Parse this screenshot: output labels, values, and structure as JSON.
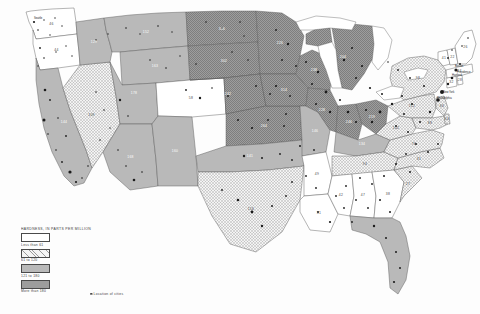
{
  "map": {
    "title": "Water hardness of public supplies in the United States",
    "legend": {
      "header": "HARDNESS, IN PARTS PER MILLION",
      "classes": [
        {
          "label": "Less than 61",
          "fill": "#ffffff",
          "pattern": "none"
        },
        {
          "label": "61 to 120",
          "fill": "#e8e8e8",
          "pattern": "crosshatch"
        },
        {
          "label": "121 to 180",
          "fill": "#b9b9b9",
          "pattern": "solid"
        },
        {
          "label": "More than 180",
          "fill": "#8c8c8c",
          "pattern": "stipple"
        }
      ],
      "city_note": "Location of cities"
    },
    "projection": "Albers equal-area conic, conterminous United States",
    "ocean_color": "#ffffff",
    "border_color": "#555555",
    "state_values": [
      {
        "state": "Washington",
        "abbr": "WA",
        "class": 0,
        "label": "46"
      },
      {
        "state": "Oregon",
        "abbr": "OR",
        "class": 0,
        "label": "44"
      },
      {
        "state": "California",
        "abbr": "CA",
        "class": 2,
        "label": "144"
      },
      {
        "state": "Idaho",
        "abbr": "ID",
        "class": 2,
        "label": "129"
      },
      {
        "state": "Nevada",
        "abbr": "NV",
        "class": 1,
        "label": "109"
      },
      {
        "state": "Montana",
        "abbr": "MT",
        "class": 2,
        "label": "152"
      },
      {
        "state": "Wyoming",
        "abbr": "WY",
        "class": 2,
        "label": "163"
      },
      {
        "state": "Utah",
        "abbr": "UT",
        "class": 2,
        "label": "178"
      },
      {
        "state": "Arizona",
        "abbr": "AZ",
        "class": 2,
        "label": "168"
      },
      {
        "state": "Colorado",
        "abbr": "CO",
        "class": 0,
        "label": "58"
      },
      {
        "state": "New Mexico",
        "abbr": "NM",
        "class": 2,
        "label": "160"
      },
      {
        "state": "North Dakota",
        "abbr": "ND",
        "class": 3,
        "label": "306"
      },
      {
        "state": "South Dakota",
        "abbr": "SD",
        "class": 3,
        "label": "302"
      },
      {
        "state": "Nebraska",
        "abbr": "NE",
        "class": 3,
        "label": "242"
      },
      {
        "state": "Kansas",
        "abbr": "KS",
        "class": 3,
        "label": "264"
      },
      {
        "state": "Oklahoma",
        "abbr": "OK",
        "class": 2,
        "label": "141"
      },
      {
        "state": "Texas",
        "abbr": "TX",
        "class": 1,
        "label": "116"
      },
      {
        "state": "Minnesota",
        "abbr": "MN",
        "class": 3,
        "label": "226"
      },
      {
        "state": "Iowa",
        "abbr": "IA",
        "class": 3,
        "label": "314"
      },
      {
        "state": "Missouri",
        "abbr": "MO",
        "class": 2,
        "label": "146"
      },
      {
        "state": "Arkansas",
        "abbr": "AR",
        "class": 0,
        "label": "49"
      },
      {
        "state": "Louisiana",
        "abbr": "LA",
        "class": 0,
        "label": "51"
      },
      {
        "state": "Wisconsin",
        "abbr": "WI",
        "class": 3,
        "label": "238"
      },
      {
        "state": "Illinois",
        "abbr": "IL",
        "class": 3,
        "label": "228"
      },
      {
        "state": "Michigan",
        "abbr": "MI",
        "class": 3,
        "label": "204"
      },
      {
        "state": "Indiana",
        "abbr": "IN",
        "class": 3,
        "label": "246"
      },
      {
        "state": "Ohio",
        "abbr": "OH",
        "class": 3,
        "label": "219"
      },
      {
        "state": "Kentucky",
        "abbr": "KY",
        "class": 2,
        "label": "134"
      },
      {
        "state": "Tennessee",
        "abbr": "TN",
        "class": 1,
        "label": "94"
      },
      {
        "state": "Mississippi",
        "abbr": "MS",
        "class": 0,
        "label": "42"
      },
      {
        "state": "Alabama",
        "abbr": "AL",
        "class": 0,
        "label": "47"
      },
      {
        "state": "Georgia",
        "abbr": "GA",
        "class": 0,
        "label": "38"
      },
      {
        "state": "Florida",
        "abbr": "FL",
        "class": 2,
        "label": "152"
      },
      {
        "state": "South Carolina",
        "abbr": "SC",
        "class": 0,
        "label": "27"
      },
      {
        "state": "North Carolina",
        "abbr": "NC",
        "class": 0,
        "label": "31"
      },
      {
        "state": "Virginia",
        "abbr": "VA",
        "class": 1,
        "label": "76"
      },
      {
        "state": "West Virginia",
        "abbr": "WV",
        "class": 1,
        "label": "102"
      },
      {
        "state": "Maryland",
        "abbr": "MD",
        "class": 1,
        "label": "88"
      },
      {
        "state": "Delaware",
        "abbr": "DE",
        "class": 1,
        "label": "64"
      },
      {
        "state": "Pennsylvania",
        "abbr": "PA",
        "class": 1,
        "label": "112"
      },
      {
        "state": "New Jersey",
        "abbr": "NJ",
        "class": 1,
        "label": "66"
      },
      {
        "state": "New York",
        "abbr": "NY",
        "class": 1,
        "label": "98"
      },
      {
        "state": "Connecticut",
        "abbr": "CT",
        "class": 0,
        "label": "32"
      },
      {
        "state": "Rhode Island",
        "abbr": "RI",
        "class": 0,
        "label": "28"
      },
      {
        "state": "Massachusetts",
        "abbr": "MA",
        "class": 0,
        "label": "24"
      },
      {
        "state": "Vermont",
        "abbr": "VT",
        "class": 0,
        "label": "41"
      },
      {
        "state": "New Hampshire",
        "abbr": "NH",
        "class": 0,
        "label": "22"
      },
      {
        "state": "Maine",
        "abbr": "ME",
        "class": 0,
        "label": "26"
      }
    ],
    "city_labels": [
      {
        "name": "Boston",
        "x": 455,
        "y": 67
      },
      {
        "name": "Hartford",
        "x": 452,
        "y": 76
      },
      {
        "name": "Providence",
        "x": 457,
        "y": 73
      },
      {
        "name": "New York",
        "x": 443,
        "y": 93
      },
      {
        "name": "Philadelphia",
        "x": 437,
        "y": 99
      },
      {
        "name": "Seattle",
        "x": 34,
        "y": 19
      }
    ]
  }
}
